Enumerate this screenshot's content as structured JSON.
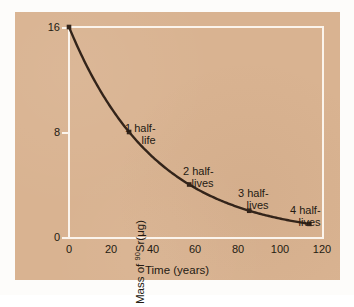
{
  "figure": {
    "background_color": "#d9b391",
    "axis_color": "#fbf4ec",
    "curve_color": "#33241a",
    "text_color": "#241a12"
  },
  "chart_data": {
    "type": "line",
    "title": "",
    "xlabel": "Time (years)",
    "ylabel_parts": {
      "prefix": "Mass of ",
      "superscript": "90",
      "suffix": "Sr(μg)"
    },
    "ylabel": "Mass of 90Sr(μg)",
    "xlim": [
      0,
      120
    ],
    "ylim": [
      0,
      16
    ],
    "xticks": [
      0,
      20,
      40,
      60,
      80,
      100,
      120
    ],
    "xtick_labels": [
      "0",
      "20",
      "40",
      "60",
      "80",
      "100",
      "120"
    ],
    "yticks": [
      0,
      8,
      16
    ],
    "ytick_labels": [
      "0",
      "8",
      "16"
    ],
    "grid": false,
    "legend": "none",
    "half_life_years": 28.5,
    "x": [
      0,
      28.5,
      57,
      85.5,
      114
    ],
    "values": [
      16,
      8,
      4,
      2,
      1
    ],
    "markers": [
      {
        "x": 0,
        "y": 16
      },
      {
        "x": 28.5,
        "y": 8
      },
      {
        "x": 57,
        "y": 4
      },
      {
        "x": 85.5,
        "y": 2
      },
      {
        "x": 114,
        "y": 1
      }
    ],
    "annotations": [
      {
        "line1": "1 half-",
        "line2": "life",
        "x": 28.5,
        "y": 8
      },
      {
        "line1": "2 half-",
        "line2": "lives",
        "x": 57,
        "y": 4
      },
      {
        "line1": "3 half-",
        "line2": "lives",
        "x": 85.5,
        "y": 2
      },
      {
        "line1": "4 half-",
        "line2": "lives",
        "x": 114,
        "y": 1
      }
    ]
  }
}
